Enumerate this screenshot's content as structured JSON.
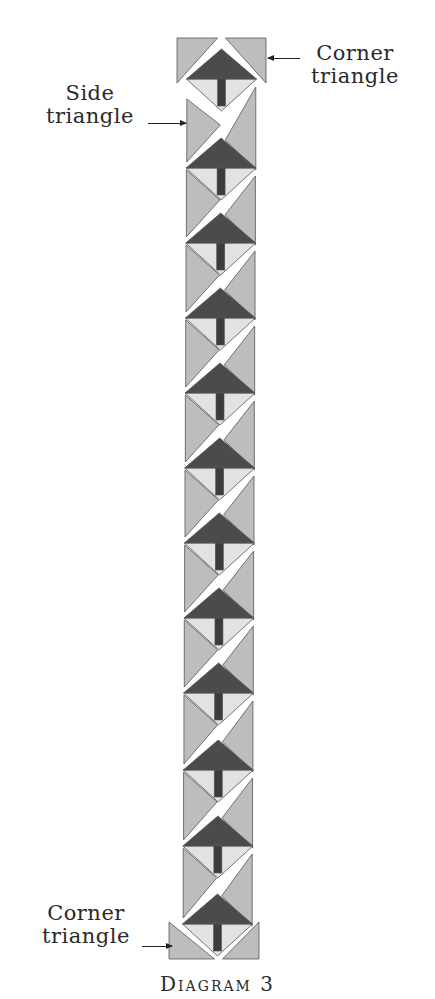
{
  "labels": {
    "corner_top": {
      "line1": "Corner",
      "line2": "triangle"
    },
    "side": {
      "line1": "Side",
      "line2": "triangle"
    },
    "corner_bottom": {
      "line1": "Corner",
      "line2": "triangle"
    }
  },
  "caption": "Diagram 3",
  "colors": {
    "tree_top": "#4b4b4b",
    "trunk": "#3c3c3c",
    "background_light": "#e2e2e2",
    "setting_triangle": "#bdbdbd",
    "outline": "#555555"
  },
  "quilt": {
    "tree_block_count": 12,
    "layout": "blocks set on point in a single vertical column with side and corner setting triangles",
    "tree_mid_y": [
      79,
      168,
      243,
      318,
      393,
      468,
      543,
      618,
      693,
      770,
      846,
      924
    ],
    "half_diagonal": 30,
    "column_left": 187,
    "column_right": 256
  }
}
